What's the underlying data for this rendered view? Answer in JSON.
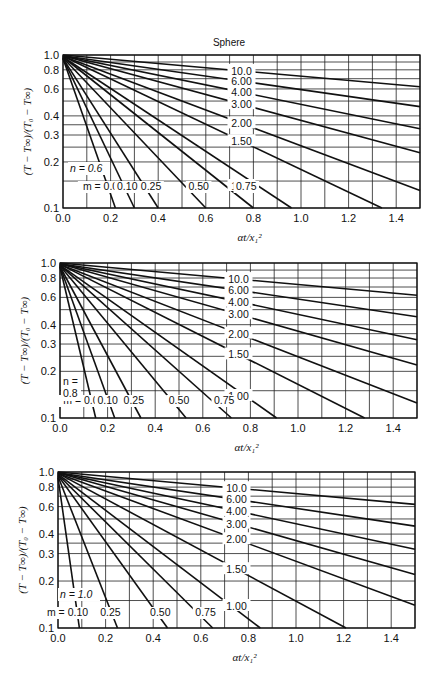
{
  "title": "Sphere",
  "chart_data": [
    {
      "type": "line",
      "title": "Sphere",
      "xlabel": "αt/x₁²",
      "ylabel": "(T − T∞)/(T₀ − T∞)",
      "xlim": [
        0.0,
        1.5
      ],
      "ylim": [
        0.1,
        1.0
      ],
      "yscale": "log",
      "grid": true,
      "x_ticks": [
        "0.0",
        "0.2",
        "0.4",
        "0.6",
        "0.8",
        "1.0",
        "1.2",
        "1.4"
      ],
      "y_ticks": [
        "0.1",
        "0.2",
        "0.3",
        "0.4",
        "0.6",
        "0.8",
        "1.0"
      ],
      "annotation": "n = 0.6",
      "series": [
        {
          "name": "m = 0.00",
          "x": [
            0.0,
            0.22
          ],
          "y": [
            0.95,
            0.1
          ]
        },
        {
          "name": "0.10",
          "x": [
            0.0,
            0.3
          ],
          "y": [
            0.95,
            0.1
          ]
        },
        {
          "name": "0.25",
          "x": [
            0.0,
            0.4
          ],
          "y": [
            0.95,
            0.1
          ]
        },
        {
          "name": "0.50",
          "x": [
            0.0,
            0.6
          ],
          "y": [
            0.96,
            0.1
          ]
        },
        {
          "name": "0.75",
          "x": [
            0.0,
            0.8
          ],
          "y": [
            0.97,
            0.1
          ]
        },
        {
          "name": "1.00",
          "x": [
            0.0,
            0.96
          ],
          "y": [
            0.97,
            0.1
          ]
        },
        {
          "name": "1.50",
          "x": [
            0.0,
            1.34
          ],
          "y": [
            0.98,
            0.1
          ]
        },
        {
          "name": "2.00",
          "x": [
            0.0,
            1.5
          ],
          "y": [
            0.98,
            0.13
          ]
        },
        {
          "name": "3.00",
          "x": [
            0.0,
            1.5
          ],
          "y": [
            0.99,
            0.23
          ]
        },
        {
          "name": "4.00",
          "x": [
            0.0,
            1.5
          ],
          "y": [
            0.99,
            0.33
          ]
        },
        {
          "name": "6.00",
          "x": [
            0.0,
            1.5
          ],
          "y": [
            0.99,
            0.46
          ]
        },
        {
          "name": "10.0",
          "x": [
            0.0,
            1.5
          ],
          "y": [
            1.0,
            0.62
          ]
        }
      ]
    },
    {
      "type": "line",
      "xlabel": "αt/x₁²",
      "ylabel": "(T − T∞)/(T₀ − T∞)",
      "xlim": [
        0.0,
        1.5
      ],
      "ylim": [
        0.1,
        1.0
      ],
      "yscale": "log",
      "grid": true,
      "x_ticks": [
        "0.0",
        "0.2",
        "0.4",
        "0.6",
        "0.8",
        "1.0",
        "1.2",
        "1.4"
      ],
      "y_ticks": [
        "0.1",
        "0.2",
        "0.3",
        "0.4",
        "0.6",
        "0.8",
        "1.0"
      ],
      "annotation": "n = 0.8",
      "series": [
        {
          "name": "m = 0.00",
          "x": [
            0.0,
            0.15
          ],
          "y": [
            0.94,
            0.1
          ]
        },
        {
          "name": "0.10",
          "x": [
            0.0,
            0.23
          ],
          "y": [
            0.95,
            0.1
          ]
        },
        {
          "name": "0.25",
          "x": [
            0.0,
            0.34
          ],
          "y": [
            0.95,
            0.1
          ]
        },
        {
          "name": "0.50",
          "x": [
            0.0,
            0.53
          ],
          "y": [
            0.96,
            0.1
          ]
        },
        {
          "name": "0.75",
          "x": [
            0.0,
            0.72
          ],
          "y": [
            0.97,
            0.1
          ]
        },
        {
          "name": "1.00",
          "x": [
            0.0,
            0.91
          ],
          "y": [
            0.97,
            0.1
          ]
        },
        {
          "name": "1.50",
          "x": [
            0.0,
            1.28
          ],
          "y": [
            0.98,
            0.1
          ]
        },
        {
          "name": "2.00",
          "x": [
            0.0,
            1.5
          ],
          "y": [
            0.98,
            0.125
          ]
        },
        {
          "name": "3.00",
          "x": [
            0.0,
            1.5
          ],
          "y": [
            0.99,
            0.22
          ]
        },
        {
          "name": "4.00",
          "x": [
            0.0,
            1.5
          ],
          "y": [
            0.99,
            0.32
          ]
        },
        {
          "name": "6.00",
          "x": [
            0.0,
            1.5
          ],
          "y": [
            0.99,
            0.45
          ]
        },
        {
          "name": "10.0",
          "x": [
            0.0,
            1.5
          ],
          "y": [
            1.0,
            0.62
          ]
        }
      ]
    },
    {
      "type": "line",
      "xlabel": "αt/x₁²",
      "ylabel": "(T − T∞)/(T₀ − T∞)",
      "xlim": [
        0.0,
        1.5
      ],
      "ylim": [
        0.1,
        1.0
      ],
      "yscale": "log",
      "grid": true,
      "x_ticks": [
        "0.0",
        "0.2",
        "0.4",
        "0.6",
        "0.8",
        "1.0",
        "1.2",
        "1.4"
      ],
      "y_ticks": [
        "0.1",
        "0.2",
        "0.3",
        "0.4",
        "0.6",
        "0.8",
        "1.0"
      ],
      "annotation": "n = 1.0",
      "series": [
        {
          "name": "m = 0.10",
          "x": [
            0.0,
            0.09
          ],
          "y": [
            0.92,
            0.1
          ]
        },
        {
          "name": "0.25",
          "x": [
            0.0,
            0.25
          ],
          "y": [
            0.94,
            0.1
          ]
        },
        {
          "name": "0.50",
          "x": [
            0.0,
            0.46
          ],
          "y": [
            0.95,
            0.1
          ]
        },
        {
          "name": "0.75",
          "x": [
            0.0,
            0.65
          ],
          "y": [
            0.96,
            0.1
          ]
        },
        {
          "name": "1.00",
          "x": [
            0.0,
            0.85
          ],
          "y": [
            0.97,
            0.1
          ]
        },
        {
          "name": "1.50",
          "x": [
            0.0,
            1.21
          ],
          "y": [
            0.98,
            0.1
          ]
        },
        {
          "name": "2.00",
          "x": [
            0.0,
            1.5
          ],
          "y": [
            0.98,
            0.14
          ]
        },
        {
          "name": "3.00",
          "x": [
            0.0,
            1.5
          ],
          "y": [
            0.99,
            0.22
          ]
        },
        {
          "name": "4.00",
          "x": [
            0.0,
            1.5
          ],
          "y": [
            0.99,
            0.32
          ]
        },
        {
          "name": "6.00",
          "x": [
            0.0,
            1.5
          ],
          "y": [
            0.99,
            0.45
          ]
        },
        {
          "name": "10.0",
          "x": [
            0.0,
            1.5
          ],
          "y": [
            1.0,
            0.62
          ]
        }
      ]
    }
  ],
  "panels": [
    {
      "box": [
        63,
        55,
        420,
        208
      ],
      "m_label_y": 190,
      "n_label": "n = 0.6",
      "n_xy": [
        70,
        172
      ],
      "title_xy": [
        229,
        46
      ]
    },
    {
      "box": [
        60,
        263,
        417,
        418
      ],
      "m_label_y": 404,
      "n_label_lines": [
        "n =",
        "0.8"
      ],
      "n_xy": [
        63,
        385
      ]
    },
    {
      "box": [
        58,
        472,
        415,
        628
      ],
      "m_label_y": 616,
      "n_label": "n = 1.0",
      "n_xy": [
        60,
        598
      ]
    }
  ]
}
